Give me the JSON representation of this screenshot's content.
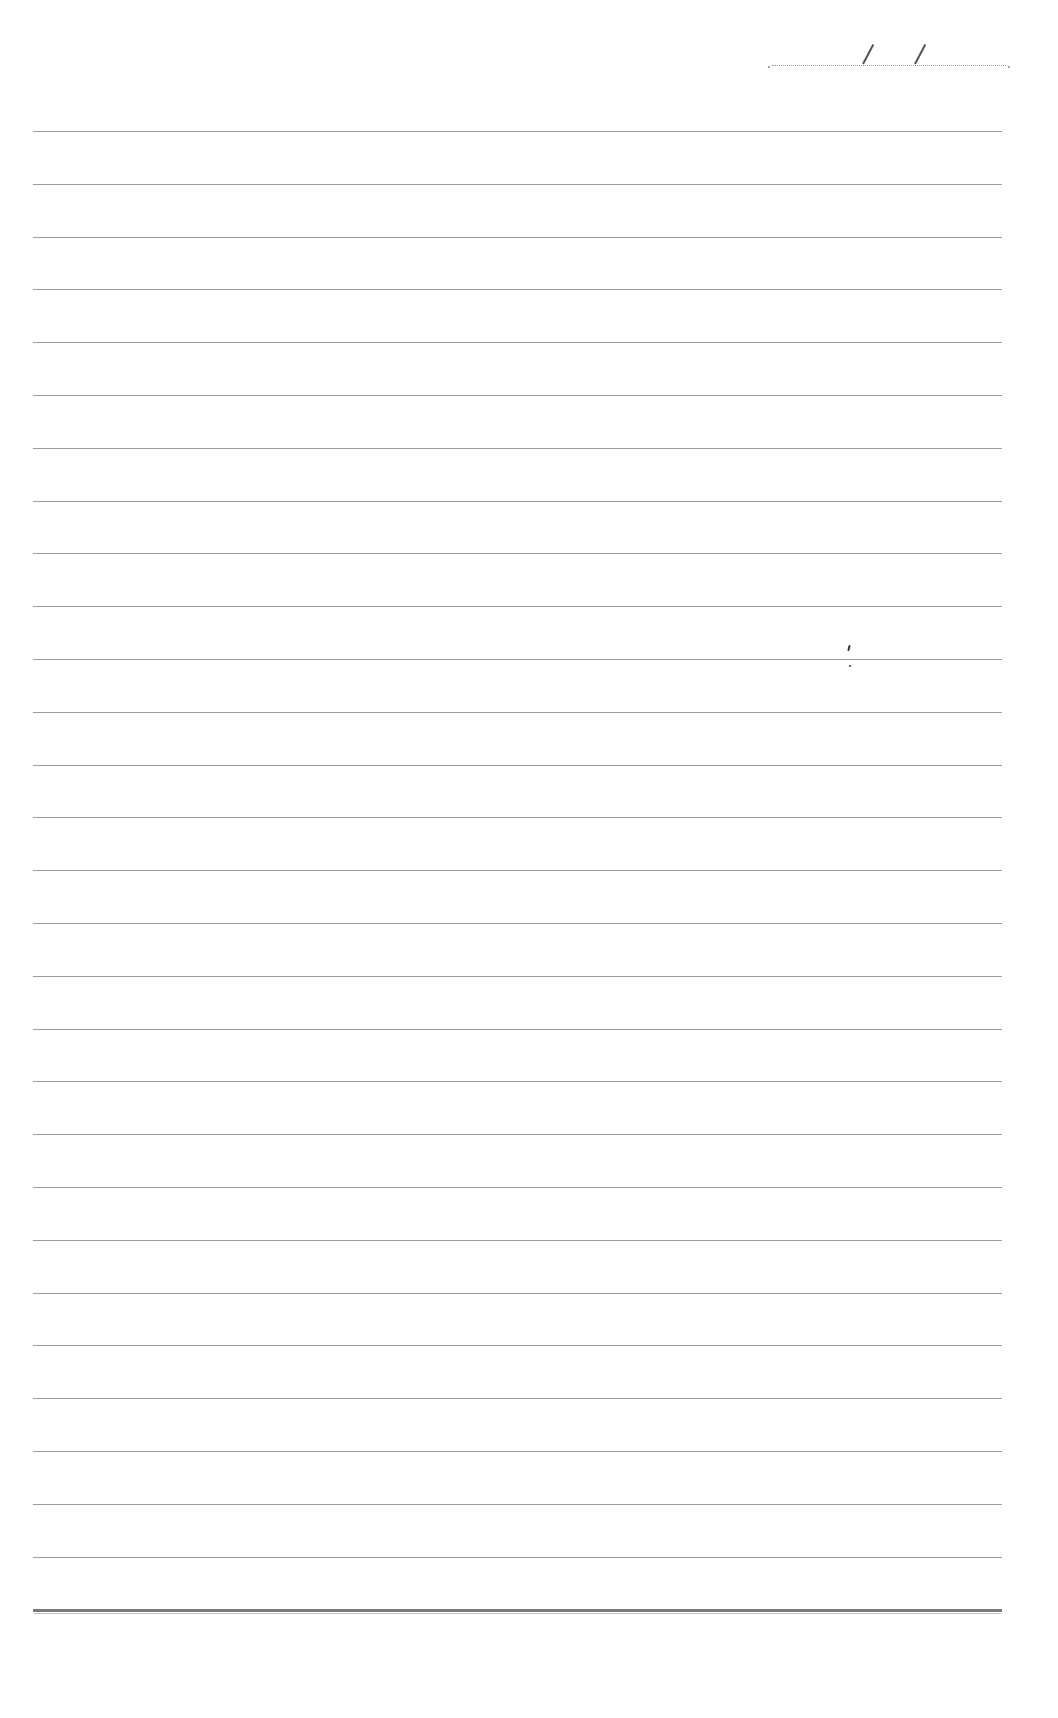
{
  "page": {
    "type": "blank ruled notebook page",
    "background_color": "#ffffff",
    "line_color": "#9c9c9c",
    "bottom_line_color": "#7a7a7a"
  },
  "date_field": {
    "separator": "/",
    "separator_count": 2,
    "value": ""
  },
  "ruled_lines": {
    "count": 29,
    "first_y": 131,
    "spacing": 52.8,
    "left": 33,
    "right": 1002,
    "last_is_thick": true
  }
}
